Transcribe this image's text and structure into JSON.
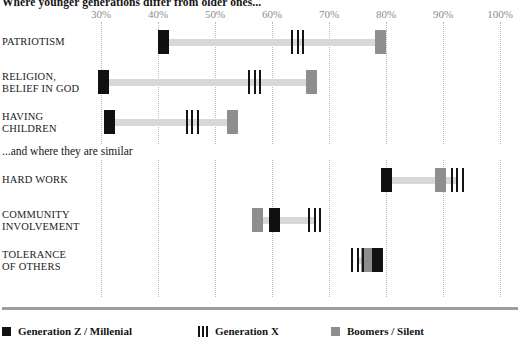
{
  "chart_data": {
    "type": "bar",
    "title": "Where younger generations differ from older ones...",
    "subtitle": "...and where they are similar",
    "xlabel": "",
    "ylabel": "",
    "xlim": [
      25,
      103
    ],
    "grid": true,
    "legend_position": "bottom",
    "axis_ticks": [
      {
        "label": "30%",
        "value": 30
      },
      {
        "label": "40%",
        "value": 40
      },
      {
        "label": "50%",
        "value": 50
      },
      {
        "label": "60%",
        "value": 60
      },
      {
        "label": "70%",
        "value": 70
      },
      {
        "label": "80%",
        "value": 80
      },
      {
        "label": "90%",
        "value": 90
      },
      {
        "label": "100%",
        "value": 100
      }
    ],
    "series": [
      {
        "name": "Generation Z / Millenial",
        "key": "genz",
        "color": "#111111"
      },
      {
        "name": "Generation X",
        "key": "genx",
        "color": "#141414"
      },
      {
        "name": "Boomers / Silent",
        "key": "boomer",
        "color": "#8e8e8e"
      }
    ],
    "groups": [
      {
        "heading": "Where younger generations differ from older ones...",
        "categories": [
          "PATRIOTISM",
          "RELIGION,\nBELIEF IN GOD",
          "HAVING\nCHILDREN"
        ],
        "rows": [
          {
            "label": "PATRIOTISM",
            "genz": 41,
            "genx": 64.5,
            "boomer": 79
          },
          {
            "label": "RELIGION,\nBELIEF IN GOD",
            "genz": 30.5,
            "genx": 57,
            "boomer": 67
          },
          {
            "label": "HAVING\nCHILDREN",
            "genz": 31.5,
            "genx": 46,
            "boomer": 53
          }
        ]
      },
      {
        "heading": "...and where they are similar",
        "categories": [
          "HARD WORK",
          "COMMUNITY\nINVOLVEMENT",
          "TOLERANCE\nOF OTHERS"
        ],
        "rows": [
          {
            "label": "HARD WORK",
            "genz": 80,
            "genx": 92.5,
            "boomer": 89.5
          },
          {
            "label": "COMMUNITY\nINVOLVEMENT",
            "genz": 60.5,
            "genx": 67.5,
            "boomer": 57.5
          },
          {
            "label": "TOLERANCE\nOF OTHERS",
            "genz": 78.5,
            "genx": 75,
            "boomer": 76.5
          }
        ]
      }
    ]
  },
  "legend": {
    "items": [
      {
        "label": "Generation Z / Millenial",
        "swatch": "genz"
      },
      {
        "label": "Generation X",
        "swatch": "genx"
      },
      {
        "label": "Boomers / Silent",
        "swatch": "boomer"
      }
    ]
  }
}
